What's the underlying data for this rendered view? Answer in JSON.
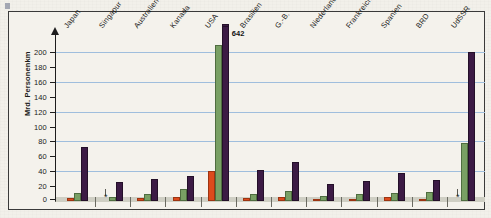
{
  "chart_data": {
    "type": "bar",
    "title": "",
    "subtitle": "",
    "xlabel": "",
    "ylabel": "Mrd. Personenkm",
    "ylim": [
      0,
      200
    ],
    "ytick_step": 20,
    "yticks": [
      "0",
      "20",
      "40",
      "60",
      "80",
      "100",
      "120",
      "140",
      "160",
      "180",
      "200"
    ],
    "gridlines_at": [
      40,
      80,
      120,
      160,
      200
    ],
    "grid": true,
    "legend_position": "none",
    "categories": [
      "Japan",
      "Singapur",
      "Australien",
      "Kanada",
      "USA",
      "Brasilien",
      "G.-B.",
      "Niederlande",
      "Frankreich",
      "Spanien",
      "BRD",
      "UdSSR"
    ],
    "series": [
      {
        "name": "series-1",
        "color": "#dd4a1c",
        "values": [
          4,
          null,
          4,
          5,
          40,
          4,
          6,
          2,
          3,
          5,
          3,
          null
        ]
      },
      {
        "name": "series-2",
        "color": "#79a064",
        "values": [
          11,
          5,
          9,
          16,
          210,
          10,
          13,
          7,
          9,
          11,
          12,
          78
        ]
      },
      {
        "name": "series-3",
        "color": "#3c1b45",
        "values": [
          72,
          26,
          30,
          34,
          642,
          41,
          53,
          23,
          27,
          37,
          28,
          200
        ]
      }
    ],
    "annotations": [
      {
        "category": "USA",
        "series": "series-3",
        "text": "642",
        "note": "bar truncated at top of plot"
      }
    ],
    "footnote_marker": "*",
    "footnote_marker_categories": [
      "Singapur",
      "UdSSR"
    ]
  },
  "axis": {
    "y_title": "Mrd. Personenkm"
  }
}
